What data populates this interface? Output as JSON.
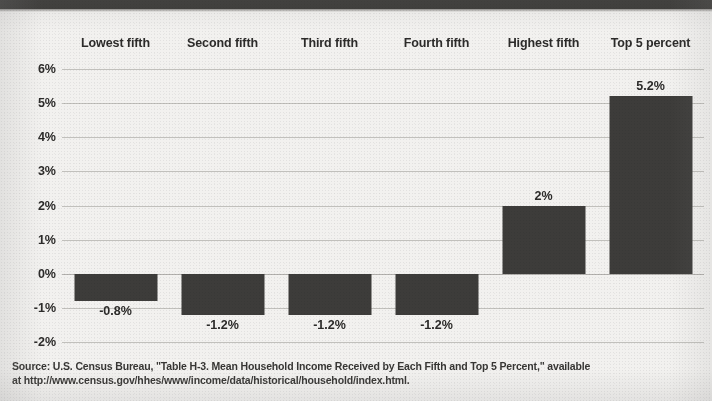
{
  "chart_data": {
    "type": "bar",
    "title": "",
    "subtitle": "",
    "xlabel": "",
    "ylabel": "",
    "categories": [
      "Lowest fifth",
      "Second fifth",
      "Third fifth",
      "Fourth fifth",
      "Highest fifth",
      "Top 5 percent"
    ],
    "values": [
      -0.8,
      -1.2,
      -1.2,
      -1.2,
      2,
      5.2
    ],
    "value_labels": [
      "-0.8%",
      "-1.2%",
      "-1.2%",
      "-1.2%",
      "2%",
      "5.2%"
    ],
    "ylim": [
      -2,
      6
    ],
    "ytick_values": [
      6,
      5,
      4,
      3,
      2,
      1,
      0,
      -1,
      -2
    ],
    "ytick_labels": [
      "6%",
      "5%",
      "4%",
      "3%",
      "2%",
      "1%",
      "0%",
      "-1%",
      "-2%"
    ],
    "grid": true,
    "grid_axis": "y",
    "legend": false,
    "legend_position": "none",
    "category_label_position": "top",
    "bar_color": "#3d3c3a",
    "gridline_color": "#b9b7b3",
    "background_color": "#f2f1ef",
    "text_color": "#2c2b2a"
  },
  "source": {
    "line1": "Source: U.S. Census Bureau, \"Table H-3. Mean Household Income Received by Each Fifth and Top 5 Percent,\" available",
    "line2": "at http://www.census.gov/hhes/www/income/data/historical/household/index.html."
  }
}
